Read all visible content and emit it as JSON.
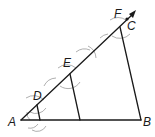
{
  "diagram": {
    "type": "geometric-construction",
    "labels": {
      "A": "A",
      "B": "B",
      "C": "C",
      "D": "D",
      "E": "E",
      "F": "F"
    },
    "points": {
      "A": [
        21,
        120
      ],
      "B": [
        141,
        120
      ],
      "D": [
        37,
        105
      ],
      "E": [
        70,
        74
      ],
      "F": [
        120,
        27
      ],
      "C": [
        120,
        27
      ],
      "ray_tip": [
        135,
        12
      ],
      "D_foot": [
        40,
        120
      ],
      "E_foot": [
        80,
        120
      ]
    },
    "colors": {
      "line": "#1a1a1a",
      "arc": "#9a9a9a",
      "background": "#ffffff"
    }
  }
}
